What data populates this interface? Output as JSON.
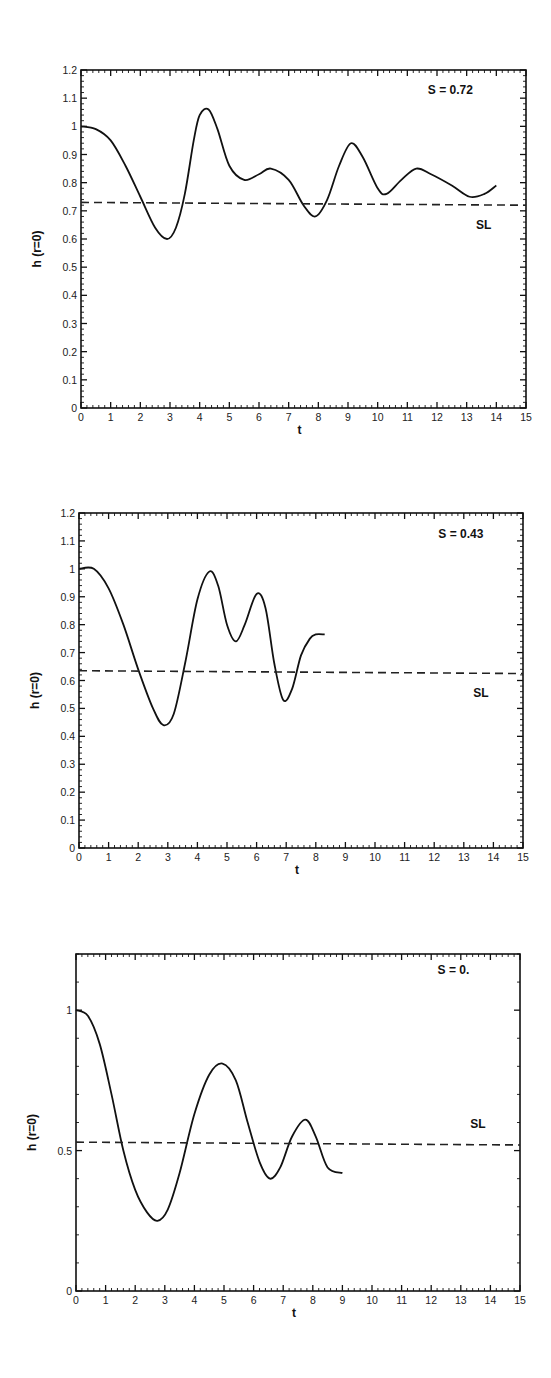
{
  "chart_data": [
    {
      "type": "line",
      "title": "",
      "annotation": "S = 0.72",
      "xlabel": "t",
      "ylabel": "h (r=0)",
      "xlim": [
        0,
        15
      ],
      "ylim": [
        0,
        1.2
      ],
      "xticks": [
        "0",
        "1",
        "2",
        "3",
        "4",
        "5",
        "6",
        "7",
        "8",
        "9",
        "10",
        "11",
        "12",
        "13",
        "14",
        "15"
      ],
      "yticks": [
        "0",
        "0.1",
        "0.2",
        "0.3",
        "0.4",
        "0.5",
        "0.6",
        "0.7",
        "0.8",
        "0.9",
        "1",
        "1.1",
        "1.2"
      ],
      "grid": false,
      "series": [
        {
          "name": "h(r=0)",
          "style": "solid",
          "x": [
            0,
            0.5,
            1,
            1.5,
            2,
            2.5,
            2.9,
            3.2,
            3.5,
            3.8,
            4.0,
            4.3,
            4.6,
            5.0,
            5.5,
            6.0,
            6.4,
            7.0,
            7.5,
            7.9,
            8.3,
            8.7,
            9.1,
            9.5,
            10.0,
            10.3,
            10.8,
            11.3,
            11.8,
            12.5,
            13.1,
            13.6,
            14.0
          ],
          "y": [
            1.0,
            0.99,
            0.95,
            0.86,
            0.75,
            0.64,
            0.6,
            0.64,
            0.76,
            0.95,
            1.04,
            1.06,
            0.99,
            0.86,
            0.81,
            0.83,
            0.85,
            0.81,
            0.72,
            0.68,
            0.74,
            0.86,
            0.94,
            0.89,
            0.78,
            0.76,
            0.81,
            0.85,
            0.83,
            0.79,
            0.75,
            0.76,
            0.79
          ]
        },
        {
          "name": "SL",
          "style": "dashed",
          "x": [
            0,
            15
          ],
          "y": [
            0.73,
            0.72
          ]
        }
      ],
      "labels": {
        "sl": "SL"
      }
    },
    {
      "type": "line",
      "title": "",
      "annotation": "S = 0.43",
      "xlabel": "t",
      "ylabel": "h (r=0)",
      "xlim": [
        0,
        15
      ],
      "ylim": [
        0,
        1.2
      ],
      "xticks": [
        "0",
        "1",
        "2",
        "3",
        "4",
        "5",
        "6",
        "7",
        "8",
        "9",
        "10",
        "11",
        "12",
        "13",
        "14",
        "15"
      ],
      "yticks": [
        "0",
        "0.1",
        "0.2",
        "0.3",
        "0.4",
        "0.5",
        "0.6",
        "0.7",
        "0.8",
        "0.9",
        "1",
        "1.1",
        "1.2"
      ],
      "grid": false,
      "series": [
        {
          "name": "h(r=0)",
          "style": "solid",
          "x": [
            0,
            0.5,
            1,
            1.5,
            2,
            2.5,
            2.85,
            3.2,
            3.6,
            4.0,
            4.4,
            4.7,
            5.0,
            5.3,
            5.6,
            6.0,
            6.3,
            6.6,
            6.9,
            7.2,
            7.5,
            7.8,
            8.0,
            8.3
          ],
          "y": [
            1.0,
            1.0,
            0.93,
            0.8,
            0.64,
            0.5,
            0.44,
            0.48,
            0.67,
            0.89,
            0.99,
            0.94,
            0.8,
            0.74,
            0.8,
            0.91,
            0.86,
            0.66,
            0.53,
            0.57,
            0.69,
            0.75,
            0.765,
            0.765
          ]
        },
        {
          "name": "SL",
          "style": "dashed",
          "x": [
            0,
            15
          ],
          "y": [
            0.635,
            0.625
          ]
        }
      ],
      "labels": {
        "sl": "SL"
      }
    },
    {
      "type": "line",
      "title": "",
      "annotation": "S = 0.",
      "xlabel": "t",
      "ylabel": "h (r=0)",
      "xlim": [
        0,
        15
      ],
      "ylim": [
        0,
        1.2
      ],
      "xticks": [
        "0",
        "1",
        "2",
        "3",
        "4",
        "5",
        "6",
        "7",
        "8",
        "9",
        "10",
        "11",
        "12",
        "13",
        "14",
        "15"
      ],
      "yticks": [
        "0",
        "0.5",
        "1"
      ],
      "grid": false,
      "series": [
        {
          "name": "h(r=0)",
          "style": "solid",
          "x": [
            0,
            0.4,
            0.8,
            1.2,
            1.6,
            2.0,
            2.4,
            2.75,
            3.1,
            3.5,
            4.0,
            4.5,
            4.95,
            5.4,
            5.8,
            6.2,
            6.55,
            6.9,
            7.3,
            7.75,
            8.1,
            8.5,
            9.0
          ],
          "y": [
            1.0,
            0.98,
            0.88,
            0.7,
            0.5,
            0.36,
            0.28,
            0.25,
            0.29,
            0.42,
            0.63,
            0.77,
            0.81,
            0.75,
            0.6,
            0.46,
            0.4,
            0.44,
            0.55,
            0.61,
            0.55,
            0.44,
            0.42
          ]
        },
        {
          "name": "SL",
          "style": "dashed",
          "x": [
            0,
            15
          ],
          "y": [
            0.53,
            0.52
          ]
        }
      ],
      "labels": {
        "sl": "SL"
      }
    }
  ]
}
